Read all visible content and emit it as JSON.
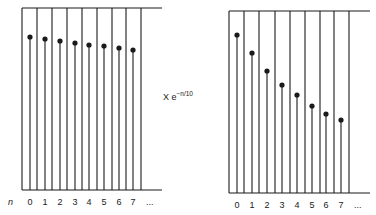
{
  "figure": {
    "ink_color": "#1a1a1a",
    "background": "#ffffff",
    "multiplier_label": {
      "base": "X e",
      "exponent": "−n/10",
      "x": 163,
      "y": 100
    },
    "index_symbol": "n",
    "ellipsis": "...",
    "panels": [
      {
        "id": "left",
        "description": "Original sequence: slowly decaying samples",
        "top_y": 8,
        "bottom_y": 190,
        "rail_x_end": 162,
        "grid_lines_x": [
          22,
          37,
          52,
          67,
          82,
          97,
          112,
          126,
          141
        ],
        "label_y": 205,
        "index_label_x": 8,
        "ellipsis_x": 146,
        "samples": [
          {
            "n": "0",
            "x": 30,
            "y": 37
          },
          {
            "n": "1",
            "x": 45,
            "y": 39
          },
          {
            "n": "2",
            "x": 60,
            "y": 41
          },
          {
            "n": "3",
            "x": 75,
            "y": 43
          },
          {
            "n": "4",
            "x": 89,
            "y": 45
          },
          {
            "n": "5",
            "x": 104,
            "y": 46
          },
          {
            "n": "6",
            "x": 119,
            "y": 48
          },
          {
            "n": "7",
            "x": 133,
            "y": 50
          }
        ]
      },
      {
        "id": "right",
        "description": "Sequence after multiplication by e^(-n/10): faster decay",
        "top_y": 11,
        "bottom_y": 193,
        "rail_x_end": 370,
        "grid_lines_x": [
          229,
          244,
          259,
          275,
          290,
          305,
          320,
          334,
          349
        ],
        "label_y": 208,
        "index_label_x": null,
        "ellipsis_x": 354,
        "samples": [
          {
            "n": "0",
            "x": 237,
            "y": 35
          },
          {
            "n": "1",
            "x": 252,
            "y": 53
          },
          {
            "n": "2",
            "x": 267,
            "y": 71
          },
          {
            "n": "3",
            "x": 282,
            "y": 85
          },
          {
            "n": "4",
            "x": 297,
            "y": 95
          },
          {
            "n": "5",
            "x": 312,
            "y": 106
          },
          {
            "n": "6",
            "x": 326,
            "y": 114
          },
          {
            "n": "7",
            "x": 341,
            "y": 120
          }
        ]
      }
    ]
  }
}
